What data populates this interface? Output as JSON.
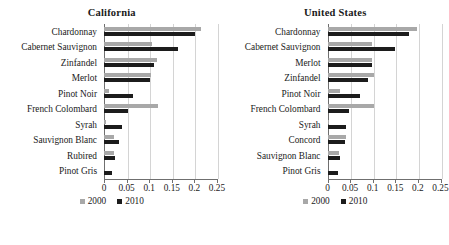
{
  "chart_data": [
    {
      "type": "bar",
      "orientation": "horizontal",
      "title": "California",
      "xlabel": "",
      "ylabel": "",
      "xlim": [
        0,
        0.25
      ],
      "xticks": [
        "0",
        "0.05",
        "0.1",
        "0.15",
        "0.2",
        "0.25"
      ],
      "xtick_values": [
        0,
        0.05,
        0.1,
        0.15,
        0.2,
        0.25
      ],
      "grid": true,
      "legend_position": "bottom",
      "categories": [
        "Chardonnay",
        "Cabernet Sauvignon",
        "Zinfandel",
        "Merlot",
        "Pinot Noir",
        "French Colombard",
        "Syrah",
        "Sauvignon Blanc",
        "Rubired",
        "Pinot Gris"
      ],
      "series": [
        {
          "name": "2000",
          "color": "#a8a8a8",
          "values": [
            0.215,
            0.107,
            0.118,
            0.103,
            0.01,
            0.12,
            0.005,
            0.022,
            0.022,
            0.0
          ]
        },
        {
          "name": "2010",
          "color": "#1c1c1c",
          "values": [
            0.202,
            0.163,
            0.11,
            0.102,
            0.065,
            0.053,
            0.04,
            0.033,
            0.025,
            0.018
          ]
        }
      ]
    },
    {
      "type": "bar",
      "orientation": "horizontal",
      "title": "United States",
      "xlabel": "",
      "ylabel": "",
      "xlim": [
        0,
        0.25
      ],
      "xticks": [
        "0",
        "0.05",
        "0.1",
        "0.15",
        "0.2",
        "0.25"
      ],
      "xtick_values": [
        0,
        0.05,
        0.1,
        0.15,
        0.2,
        0.25
      ],
      "grid": true,
      "legend_position": "bottom",
      "categories": [
        "Chardonnay",
        "Cabernet Sauvignon",
        "Merlot",
        "Zinfandel",
        "Pinot Noir",
        "French Colombard",
        "Syrah",
        "Concord",
        "Sauvignon Blanc",
        "Pinot Gris"
      ],
      "series": [
        {
          "name": "2000",
          "color": "#a8a8a8",
          "values": [
            0.198,
            0.098,
            0.098,
            0.102,
            0.028,
            0.102,
            0.004,
            0.04,
            0.025,
            0.0
          ]
        },
        {
          "name": "2010",
          "color": "#1c1c1c",
          "values": [
            0.18,
            0.15,
            0.098,
            0.09,
            0.073,
            0.047,
            0.04,
            0.038,
            0.028,
            0.023
          ]
        }
      ]
    }
  ],
  "legend": {
    "entries": [
      {
        "label": "2000",
        "color": "#a8a8a8"
      },
      {
        "label": "2010",
        "color": "#1c1c1c"
      }
    ]
  }
}
